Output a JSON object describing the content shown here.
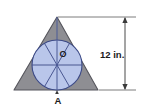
{
  "figure": {
    "colors": {
      "triangle_fill": "#8e8e93",
      "triangle_stroke": "#55555c",
      "circle_fill": "#b9c6ea",
      "circle_stroke": "#3c4a87",
      "chord_stroke": "#3c4a87",
      "axis_line": "#4a5a96",
      "dimension_line": "#4a4a4a",
      "extension_line": "#6e6e6e",
      "text": "#1b1b1b",
      "background": "#ffffff"
    },
    "labels": {
      "center_point": "O",
      "bottom_vertex": "A",
      "dimension": "12 in."
    },
    "geometry": {
      "triangle": {
        "apex": [
          57,
          17
        ],
        "base_left": [
          14,
          90
        ],
        "base_right": [
          98,
          90
        ]
      },
      "circle": {
        "center": [
          57,
          65
        ],
        "radius": 25
      },
      "dimension_line": {
        "x": 125,
        "y_top": 17,
        "y_bottom": 90,
        "value": 12,
        "unit": "in."
      },
      "chord_angles_deg": [
        0,
        60,
        120
      ],
      "altitude_line": {
        "from": [
          57,
          17
        ],
        "to": [
          57,
          90
        ]
      }
    }
  }
}
